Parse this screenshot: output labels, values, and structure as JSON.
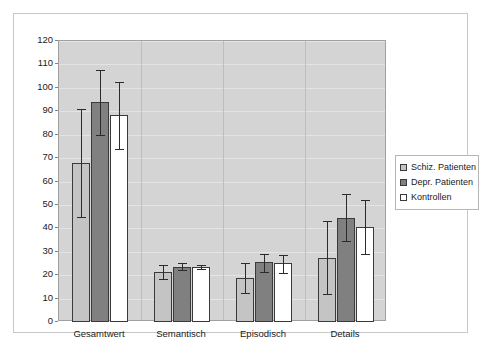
{
  "chart_data": {
    "type": "bar",
    "title": "",
    "subtitle": "",
    "xlabel": "",
    "ylabel": "",
    "ylim": [
      0,
      120
    ],
    "ytick_step": 10,
    "yticks": [
      0,
      10,
      20,
      30,
      40,
      50,
      60,
      70,
      80,
      90,
      100,
      110,
      120
    ],
    "ytick_labels": [
      "0",
      "10",
      "20",
      "30",
      "40",
      "50",
      "60",
      "70",
      "80",
      "90",
      "100",
      "110",
      "120"
    ],
    "grid": true,
    "grid_axis": "y",
    "legend_position": "right",
    "error_bars": true,
    "categories": [
      "Gesamtwert",
      "Semantisch",
      "Episodisch",
      "Details"
    ],
    "series": [
      {
        "name": "Schiz. Patienten",
        "color": "#c4c4c4",
        "values": [
          68,
          21.5,
          19,
          27.5
        ],
        "err_low": [
          45,
          18.5,
          12.5,
          12
        ],
        "err_high": [
          91,
          24.5,
          25,
          43
        ]
      },
      {
        "name": "Depr. Patienten",
        "color": "#808080",
        "values": [
          94,
          23.5,
          25.5,
          44.5
        ],
        "err_low": [
          80,
          22,
          21.5,
          34.5
        ],
        "err_high": [
          107.5,
          25,
          29,
          54.5
        ]
      },
      {
        "name": "Kontrollen",
        "color": "#ffffff",
        "values": [
          88.5,
          23.5,
          25,
          40.5
        ],
        "err_low": [
          74,
          22.5,
          21,
          29
        ],
        "err_high": [
          102.5,
          24.5,
          28.5,
          52
        ]
      }
    ]
  },
  "legend": {
    "items": [
      {
        "label": "Schiz. Patienten",
        "color": "#c4c4c4"
      },
      {
        "label": "Depr. Patienten",
        "color": "#808080"
      },
      {
        "label": "Kontrollen",
        "color": "#ffffff"
      }
    ]
  },
  "colors": {
    "plot_background": "#d4d4d4",
    "gridline": "#e4e4e4",
    "bar_outline": "#3a3a3a",
    "error_bar": "#2b2b2b",
    "frame": "#c8c8c8",
    "text": "#1a1a1a"
  }
}
